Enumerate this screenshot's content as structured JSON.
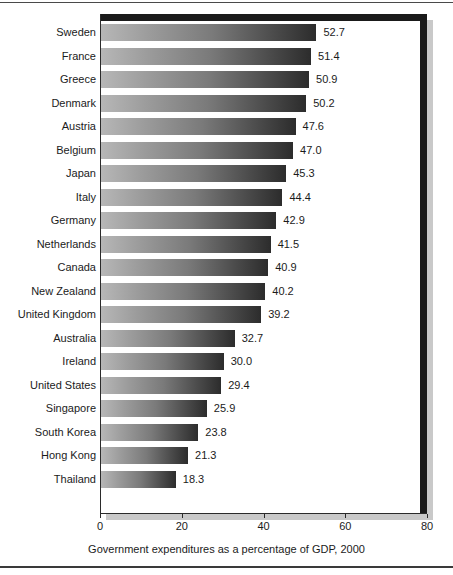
{
  "chart_data": {
    "type": "bar",
    "orientation": "horizontal",
    "title": "",
    "xlabel": "Government expenditures as a percentage of GDP, 2000",
    "ylabel": "",
    "xlim": [
      0,
      80
    ],
    "xticks": [
      0,
      20,
      40,
      60,
      80
    ],
    "xtick_labels": [
      "0",
      "20",
      "40",
      "60",
      "80"
    ],
    "grid": false,
    "legend": false,
    "categories": [
      "Sweden",
      "France",
      "Greece",
      "Denmark",
      "Austria",
      "Belgium",
      "Japan",
      "Italy",
      "Germany",
      "Netherlands",
      "Canada",
      "New Zealand",
      "United Kingdom",
      "Australia",
      "Ireland",
      "United States",
      "Singapore",
      "South Korea",
      "Hong Kong",
      "Thailand"
    ],
    "values": [
      52.7,
      51.4,
      50.9,
      50.2,
      47.6,
      47.0,
      45.3,
      44.4,
      42.9,
      41.5,
      40.9,
      40.2,
      39.2,
      32.7,
      30.0,
      29.4,
      25.9,
      23.8,
      21.3,
      18.3
    ],
    "value_labels": [
      "52.7",
      "51.4",
      "50.9",
      "50.2",
      "47.6",
      "47.0",
      "45.3",
      "44.4",
      "42.9",
      "41.5",
      "40.9",
      "40.2",
      "39.2",
      "32.7",
      "30.0",
      "29.4",
      "25.9",
      "23.8",
      "21.3",
      "18.3"
    ],
    "bar_gradient_from": "#b7b7b7",
    "bar_gradient_to": "#2c2c2c",
    "frame_color": "#1a1a1a",
    "shadow_color": "#c9c9c9"
  }
}
